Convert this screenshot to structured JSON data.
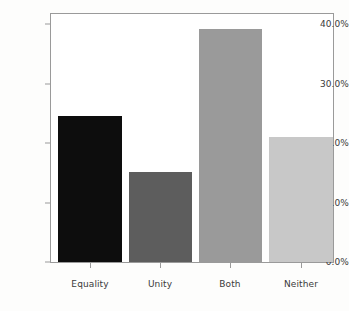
{
  "chart_data": {
    "type": "bar",
    "title": "",
    "subtitle": "",
    "xlabel": "",
    "ylabel": "",
    "categories": [
      "Equality",
      "Unity",
      "Both",
      "Neither"
    ],
    "values": [
      24.5,
      15.1,
      39.1,
      21.0
    ],
    "value_labels": [
      "24.5%",
      "15.1%",
      "39.1%",
      "21.0%"
    ],
    "series": [
      {
        "name": "Percent of responses",
        "values": [
          24.5,
          15.1,
          39.1,
          21.0
        ]
      }
    ],
    "bar_colors": [
      "#0d0d0d",
      "#5d5d5d",
      "#9a9a9a",
      "#c8c8c8"
    ],
    "ylim": [
      0,
      40
    ],
    "ytick_values": [
      0,
      10,
      20,
      30,
      40
    ],
    "ytick_labels": [
      "0.0%",
      "10.0%",
      "20.0%",
      "30.0%",
      "40.0%"
    ],
    "grid": false,
    "legend": false,
    "legend_position": "none",
    "axis_color": "#9a9a9a",
    "tick_label_color": "#3a3a3a",
    "plot_background": "#ffffff",
    "figure_background": "#fdfdfc"
  }
}
